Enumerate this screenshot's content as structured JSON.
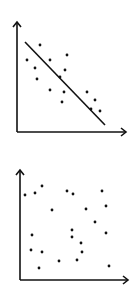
{
  "chart_data": [
    {
      "type": "scatter",
      "title": "",
      "xlabel": "",
      "ylabel": "",
      "description": "Negative correlation with fitted trend line",
      "grid": false,
      "legend": null,
      "axes": {
        "origin": [
          17,
          132
        ],
        "x_end": 126,
        "y_end": 22
      },
      "trend_line": {
        "x1": 25,
        "y1": 42,
        "x2": 105,
        "y2": 125
      },
      "points": [
        [
          40,
          45
        ],
        [
          27,
          60
        ],
        [
          50,
          60
        ],
        [
          67,
          55
        ],
        [
          35,
          68
        ],
        [
          65,
          70
        ],
        [
          37,
          79
        ],
        [
          60,
          77
        ],
        [
          50,
          90
        ],
        [
          64,
          92
        ],
        [
          87,
          92
        ],
        [
          62,
          102
        ],
        [
          95,
          100
        ],
        [
          91,
          109
        ],
        [
          100,
          111
        ]
      ]
    },
    {
      "type": "scatter",
      "title": "",
      "xlabel": "",
      "ylabel": "",
      "description": "No correlation, randomly scattered points",
      "grid": false,
      "legend": null,
      "axes": {
        "origin": [
          20,
          280
        ],
        "x_end": 128,
        "y_end": 170
      },
      "trend_line": null,
      "points": [
        [
          42,
          186
        ],
        [
          25,
          195
        ],
        [
          35,
          193
        ],
        [
          67,
          191
        ],
        [
          73,
          194
        ],
        [
          102,
          191
        ],
        [
          52,
          210
        ],
        [
          86,
          209
        ],
        [
          106,
          206
        ],
        [
          95,
          222
        ],
        [
          72,
          230
        ],
        [
          32,
          235
        ],
        [
          106,
          233
        ],
        [
          72,
          237
        ],
        [
          81,
          243
        ],
        [
          31,
          250
        ],
        [
          42,
          252
        ],
        [
          82,
          252
        ],
        [
          59,
          261
        ],
        [
          77,
          260
        ],
        [
          109,
          266
        ],
        [
          39,
          268
        ]
      ]
    }
  ],
  "colors": {
    "ink": "#111111",
    "background": "#ffffff"
  }
}
